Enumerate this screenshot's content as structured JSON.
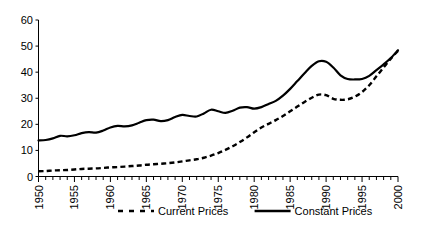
{
  "chart_data": {
    "type": "line",
    "title": "",
    "subtitle": "",
    "xlabel": "",
    "ylabel": "",
    "xlim": [
      1950,
      2000
    ],
    "ylim": [
      0,
      60
    ],
    "grid": false,
    "legend_position": "bottom",
    "y_ticks": [
      0,
      10,
      20,
      30,
      40,
      50,
      60
    ],
    "y_tick_labels": [
      "0",
      "10",
      "20",
      "30",
      "40",
      "50",
      "60"
    ],
    "x_ticks": [
      1950,
      1955,
      1960,
      1965,
      1970,
      1975,
      1980,
      1985,
      1990,
      1995,
      2000
    ],
    "x_tick_labels": [
      "1950",
      "1955",
      "1960",
      "1965",
      "1970",
      "1975",
      "1980",
      "1985",
      "1990",
      "1995",
      "2000"
    ],
    "x_minor_tick_interval": 1,
    "x": [
      1950,
      1951,
      1952,
      1953,
      1954,
      1955,
      1956,
      1957,
      1958,
      1959,
      1960,
      1961,
      1962,
      1963,
      1964,
      1965,
      1966,
      1967,
      1968,
      1969,
      1970,
      1971,
      1972,
      1973,
      1974,
      1975,
      1976,
      1977,
      1978,
      1979,
      1980,
      1981,
      1982,
      1983,
      1984,
      1985,
      1986,
      1987,
      1988,
      1989,
      1990,
      1991,
      1992,
      1993,
      1994,
      1995,
      1996,
      1997,
      1998,
      1999,
      2000
    ],
    "series": [
      {
        "name": "Current Prices",
        "style": "dashed",
        "color": "#000000",
        "values": [
          2.0,
          2.1,
          2.3,
          2.4,
          2.5,
          2.7,
          2.9,
          3.0,
          3.1,
          3.3,
          3.5,
          3.6,
          3.8,
          4.0,
          4.2,
          4.5,
          4.7,
          4.9,
          5.1,
          5.4,
          5.8,
          6.2,
          6.6,
          7.2,
          8.0,
          9.0,
          10.2,
          11.6,
          13.2,
          15.0,
          17.0,
          18.8,
          20.2,
          21.6,
          23.2,
          25.0,
          26.8,
          28.6,
          30.2,
          31.4,
          31.2,
          29.8,
          29.4,
          29.6,
          30.6,
          32.4,
          35.0,
          38.4,
          41.8,
          45.2,
          48.2
        ]
      },
      {
        "name": "Constant Prices",
        "style": "solid",
        "color": "#000000",
        "values": [
          13.8,
          14.0,
          14.6,
          15.6,
          15.4,
          15.8,
          16.6,
          17.0,
          16.8,
          17.6,
          18.8,
          19.4,
          19.2,
          19.6,
          20.6,
          21.6,
          21.8,
          21.2,
          21.6,
          22.8,
          23.6,
          23.2,
          23.0,
          24.2,
          25.6,
          25.0,
          24.4,
          25.2,
          26.4,
          26.6,
          26.0,
          26.6,
          27.8,
          29.0,
          31.0,
          33.6,
          36.6,
          39.6,
          42.4,
          44.2,
          44.0,
          41.8,
          38.8,
          37.4,
          37.2,
          37.4,
          38.6,
          40.8,
          43.0,
          45.4,
          48.4
        ]
      }
    ],
    "legend": [
      {
        "label": "Current Prices",
        "style": "dashed"
      },
      {
        "label": "Constant Prices",
        "style": "solid"
      }
    ]
  }
}
